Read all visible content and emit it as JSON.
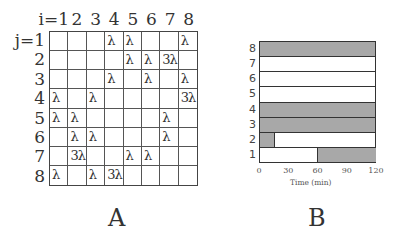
{
  "panel_a": {
    "label": "A",
    "col_header_prefix": "i=",
    "row_header_prefix": "j=",
    "col_headers": [
      "i=1",
      "2",
      "3",
      "4",
      "5",
      "6",
      "7",
      "8"
    ],
    "row_headers": [
      "j=1",
      "2",
      "3",
      "4",
      "5",
      "6",
      "7",
      "8"
    ],
    "cells": [
      [
        "",
        "",
        "",
        "λ",
        "λ",
        "",
        "",
        "λ"
      ],
      [
        "",
        "",
        "",
        "",
        "λ",
        "λ",
        "3λ",
        ""
      ],
      [
        "",
        "",
        "",
        "λ",
        "",
        "λ",
        "",
        "λ"
      ],
      [
        "λ",
        "",
        "λ",
        "",
        "",
        "",
        "",
        "3λ"
      ],
      [
        "λ",
        "λ",
        "",
        "",
        "",
        "",
        "λ",
        ""
      ],
      [
        "",
        "λ",
        "λ",
        "",
        "",
        "",
        "λ",
        ""
      ],
      [
        "",
        "3λ",
        "",
        "",
        "λ",
        "λ",
        "",
        ""
      ],
      [
        "λ",
        "",
        "λ",
        "3λ",
        "",
        "",
        "",
        ""
      ]
    ]
  },
  "panel_b": {
    "label": "B",
    "xlabel": "Time (min)",
    "xticks": [
      "0",
      "30",
      "60",
      "90",
      "120"
    ],
    "rows": [
      {
        "label": "8",
        "shaded": [
          [
            0,
            120
          ]
        ]
      },
      {
        "label": "7",
        "shaded": []
      },
      {
        "label": "6",
        "shaded": []
      },
      {
        "label": "5",
        "shaded": []
      },
      {
        "label": "4",
        "shaded": [
          [
            0,
            120
          ]
        ]
      },
      {
        "label": "3",
        "shaded": [
          [
            0,
            120
          ]
        ]
      },
      {
        "label": "2",
        "shaded": [
          [
            0,
            15
          ]
        ]
      },
      {
        "label": "1",
        "shaded": [
          [
            60,
            120
          ]
        ]
      }
    ]
  },
  "chart_data": {
    "type": "bar",
    "title": "",
    "xlabel": "Time (min)",
    "ylabel": "",
    "xlim": [
      0,
      120
    ],
    "xticks": [
      0,
      30,
      60,
      90,
      120
    ],
    "categories": [
      "1",
      "2",
      "3",
      "4",
      "5",
      "6",
      "7",
      "8"
    ],
    "series": [
      {
        "name": "shaded interval start (min)",
        "values": [
          60,
          0,
          0,
          0,
          null,
          null,
          null,
          0
        ]
      },
      {
        "name": "shaded interval end (min)",
        "values": [
          120,
          15,
          120,
          120,
          null,
          null,
          null,
          120
        ]
      }
    ],
    "grid": false,
    "legend": "none"
  }
}
